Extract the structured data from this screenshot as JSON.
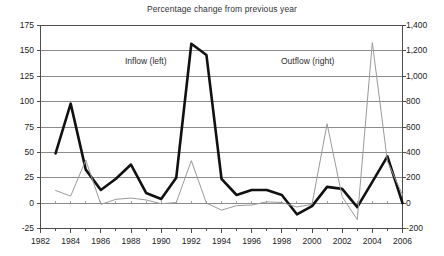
{
  "chart_data": {
    "type": "line",
    "title": "Percentage change from previous year",
    "xlabel": "",
    "ylabel": "",
    "grid": true,
    "legend_position": "inline-annotations",
    "x": [
      1983,
      1984,
      1985,
      1986,
      1987,
      1988,
      1989,
      1990,
      1991,
      1992,
      1993,
      1994,
      1995,
      1996,
      1997,
      1998,
      1999,
      2000,
      2001,
      2002,
      2003,
      2004,
      2005,
      2006
    ],
    "x_tick_labels": [
      "1982",
      "1984",
      "1986",
      "1988",
      "1990",
      "1992",
      "1994",
      "1996",
      "1998",
      "2000",
      "2002",
      "2004",
      "2006"
    ],
    "x_tick_values": [
      1982,
      1984,
      1986,
      1988,
      1990,
      1992,
      1994,
      1996,
      1998,
      2000,
      2002,
      2004,
      2006
    ],
    "xlim": [
      1982,
      2006
    ],
    "axes": [
      {
        "id": "left",
        "label": "Inflow (left)",
        "ylim": [
          -25,
          175
        ],
        "ticks": [
          -25,
          0,
          25,
          50,
          75,
          100,
          125,
          150,
          175
        ],
        "tick_labels": [
          "-25",
          "0",
          "25",
          "50",
          "75",
          "100",
          "125",
          "150",
          "175"
        ]
      },
      {
        "id": "right",
        "label": "Outflow (right)",
        "ylim": [
          -200,
          1400
        ],
        "ticks": [
          -200,
          0,
          200,
          400,
          600,
          800,
          1000,
          1200,
          1400
        ],
        "tick_labels": [
          "-200",
          "0",
          "200",
          "400",
          "600",
          "800",
          "1,000",
          "1,200",
          "1,400"
        ]
      }
    ],
    "series": [
      {
        "name": "Inflow (left)",
        "axis": "left",
        "color": "#111111",
        "line_width": 2.6,
        "values": [
          49,
          98,
          33,
          13,
          24,
          38,
          10,
          4,
          25,
          157,
          146,
          24,
          8,
          13,
          13,
          8,
          -11,
          -3,
          16,
          14,
          -4,
          21,
          46,
          0
        ]
      },
      {
        "name": "Outflow (right)",
        "axis": "right",
        "color": "#9a9a9a",
        "line_width": 1.0,
        "values": [
          100,
          55,
          340,
          -10,
          30,
          40,
          25,
          -5,
          5,
          335,
          0,
          -55,
          -20,
          -15,
          10,
          5,
          -30,
          -10,
          625,
          50,
          -130,
          1265,
          330,
          65
        ]
      }
    ],
    "annotations": [
      {
        "text": "Inflow (left)",
        "x_px": 125,
        "y_px": 56
      },
      {
        "text": "Outflow (right)",
        "x_px": 281,
        "y_px": 56
      }
    ]
  },
  "chart": {
    "title": "Percentage change from previous year",
    "left_axis_ticks": [
      "175",
      "150",
      "125",
      "100",
      "75",
      "50",
      "25",
      "0",
      "-25"
    ],
    "right_axis_ticks": [
      "1,400",
      "1,200",
      "1,000",
      "800",
      "600",
      "400",
      "200",
      "0",
      "-200"
    ],
    "x_axis_ticks": [
      "1982",
      "1984",
      "1986",
      "1988",
      "1990",
      "1992",
      "1994",
      "1996",
      "1998",
      "2000",
      "2002",
      "2004",
      "2006"
    ],
    "inflow_label": "Inflow (left)",
    "outflow_label": "Outflow (right)"
  },
  "colors": {
    "inflow_line": "#111111",
    "outflow_line": "#9a9a9a",
    "gridline": "#8c8c8c",
    "axis": "#4d4d4d",
    "background": "#ffffff",
    "text": "#222222"
  }
}
